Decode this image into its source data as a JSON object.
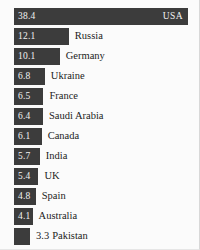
{
  "chart_data": {
    "type": "bar",
    "orientation": "horizontal",
    "title": "",
    "subtitle": "",
    "xlabel": "",
    "ylabel": "",
    "grid": false,
    "legend": "none",
    "xlim": [
      0,
      38.4
    ],
    "categories": [
      "USA",
      "Russia",
      "Germany",
      "Ukraine",
      "France",
      "Saudi Arabia",
      "Canada",
      "India",
      "UK",
      "Spain",
      "Australia",
      "Pakistan"
    ],
    "values": [
      38.4,
      12.1,
      10.1,
      6.8,
      6.5,
      6.4,
      6.1,
      5.7,
      5.4,
      4.8,
      4.1,
      3.3
    ],
    "bar_color": "#3c3c3c",
    "inside_text_color": "#f2f2f2",
    "outside_text_color": "#1c1c1c",
    "background_color": "#fbfbfb"
  },
  "bars": [
    {
      "label": "USA",
      "value": "38.4",
      "label_placement": "inside-right",
      "value_placement": "inside"
    },
    {
      "label": "Russia",
      "value": "12.1",
      "label_placement": "outside",
      "value_placement": "inside"
    },
    {
      "label": "Germany",
      "value": "10.1",
      "label_placement": "outside",
      "value_placement": "inside"
    },
    {
      "label": "Ukraine",
      "value": "6.8",
      "label_placement": "outside",
      "value_placement": "inside"
    },
    {
      "label": "France",
      "value": "6.5",
      "label_placement": "outside",
      "value_placement": "inside"
    },
    {
      "label": "Saudi Arabia",
      "value": "6.4",
      "label_placement": "outside",
      "value_placement": "inside"
    },
    {
      "label": "Canada",
      "value": "6.1",
      "label_placement": "outside",
      "value_placement": "inside"
    },
    {
      "label": "India",
      "value": "5.7",
      "label_placement": "outside",
      "value_placement": "inside"
    },
    {
      "label": "UK",
      "value": "5.4",
      "label_placement": "outside",
      "value_placement": "inside"
    },
    {
      "label": "Spain",
      "value": "4.8",
      "label_placement": "outside",
      "value_placement": "inside"
    },
    {
      "label": "Australia",
      "value": "4.1",
      "label_placement": "outside",
      "value_placement": "inside"
    },
    {
      "label": "Pakistan",
      "value": "3.3",
      "label_placement": "outside",
      "value_placement": "outside"
    }
  ]
}
